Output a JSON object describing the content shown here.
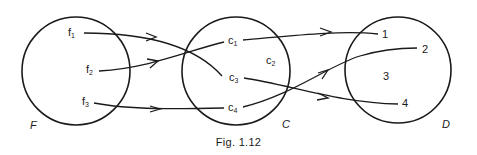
{
  "figure": {
    "caption": "Fig. 1.12",
    "sets": [
      {
        "name": "F",
        "elements": [
          {
            "base": "f",
            "sub": "1"
          },
          {
            "base": "f",
            "sub": "2"
          },
          {
            "base": "f",
            "sub": "3"
          }
        ]
      },
      {
        "name": "C",
        "elements": [
          {
            "base": "c",
            "sub": "1"
          },
          {
            "base": "c",
            "sub": "2"
          },
          {
            "base": "c",
            "sub": "3"
          },
          {
            "base": "c",
            "sub": "4"
          }
        ]
      },
      {
        "name": "D",
        "elements": [
          {
            "base": "1"
          },
          {
            "base": "2"
          },
          {
            "base": "3"
          },
          {
            "base": "4"
          }
        ]
      }
    ],
    "mappings": [
      {
        "from": "f1",
        "to": "c3"
      },
      {
        "from": "f2",
        "to": "c1"
      },
      {
        "from": "f3",
        "to": "c4"
      },
      {
        "from": "c1",
        "to": "1"
      },
      {
        "from": "c3",
        "to": "4"
      },
      {
        "from": "c4",
        "to": "2"
      }
    ]
  }
}
